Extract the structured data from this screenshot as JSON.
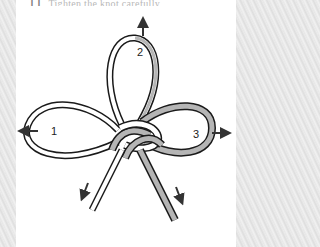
{
  "caption": {
    "step_number": "11",
    "text": "Tighten the knot carefully"
  },
  "diagram": {
    "loop_labels": {
      "left": "1",
      "top": "2",
      "right": "3"
    },
    "colors": {
      "cord_white": "#ffffff",
      "cord_grey": "#b5b5b5",
      "outline": "#1a1a1a",
      "arrow": "#333333",
      "panel": "#ffffff"
    }
  }
}
